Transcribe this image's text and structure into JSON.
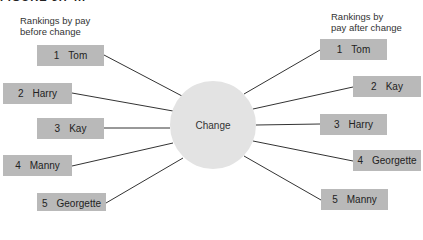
{
  "figure": {
    "partial_title": "FIGURE 5.7 ..."
  },
  "left_heading": {
    "line1": "Rankings by pay",
    "line2": "before change"
  },
  "right_heading": {
    "line1": "Rankings by",
    "line2": "pay after change"
  },
  "center": {
    "label": "Change",
    "color": "#e3e3e3"
  },
  "box_color": "#b9b9b9",
  "before": [
    {
      "rank": "1",
      "name": "Tom"
    },
    {
      "rank": "2",
      "name": "Harry"
    },
    {
      "rank": "3",
      "name": "Kay"
    },
    {
      "rank": "4",
      "name": "Manny"
    },
    {
      "rank": "5",
      "name": "Georgette"
    }
  ],
  "after": [
    {
      "rank": "1",
      "name": "Tom"
    },
    {
      "rank": "2",
      "name": "Kay"
    },
    {
      "rank": "3",
      "name": "Harry"
    },
    {
      "rank": "4",
      "name": "Georgette"
    },
    {
      "rank": "5",
      "name": "Manny"
    }
  ]
}
